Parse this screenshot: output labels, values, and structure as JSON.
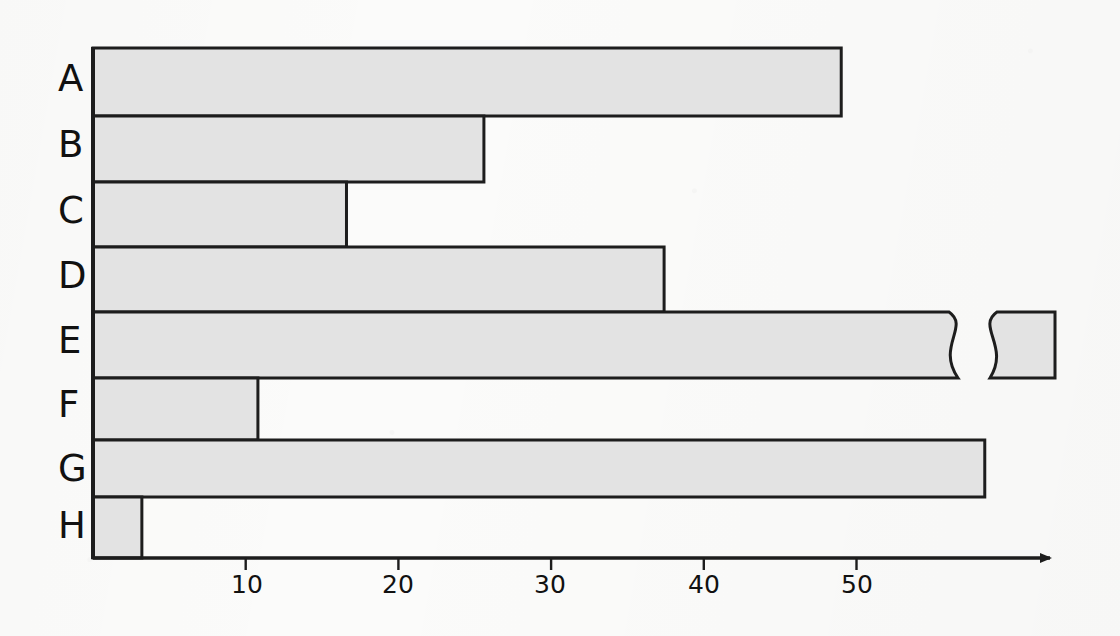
{
  "chart_data": {
    "type": "bar",
    "orientation": "horizontal",
    "title": "",
    "xlabel": "",
    "ylabel": "",
    "categories": [
      "A",
      "B",
      "C",
      "D",
      "E",
      "F",
      "G",
      "H"
    ],
    "values": [
      49,
      25.6,
      16.6,
      37.4,
      63,
      10.8,
      58.4,
      3.2
    ],
    "bars": [
      {
        "category": "A",
        "value": 49,
        "broken": false
      },
      {
        "category": "B",
        "value": 25.6,
        "broken": false
      },
      {
        "category": "C",
        "value": 16.6,
        "broken": false
      },
      {
        "category": "D",
        "value": 37.4,
        "broken": false
      },
      {
        "category": "E",
        "value": 63,
        "broken": true,
        "note": "axis-break: bar truncated with squiggle, detached end segment"
      },
      {
        "category": "F",
        "value": 10.8,
        "broken": false
      },
      {
        "category": "G",
        "value": 58.4,
        "broken": false
      },
      {
        "category": "H",
        "value": 3.2,
        "broken": false
      }
    ],
    "xticks": [
      10,
      20,
      30,
      40,
      50
    ],
    "xtick_labels": [
      "10",
      "20",
      "30",
      "40",
      "50"
    ],
    "xlim": [
      0,
      63
    ],
    "grid": false,
    "legend": null,
    "colors": {
      "bar_fill": "#e3e3e3",
      "bar_edge": "#1d1d1d",
      "axis": "#1d1d1d",
      "text": "#111111",
      "background": "#fbfbfa"
    }
  },
  "axis": {
    "arrow": "right-arrow-head",
    "baseline_label": "",
    "origin_value": 0
  }
}
